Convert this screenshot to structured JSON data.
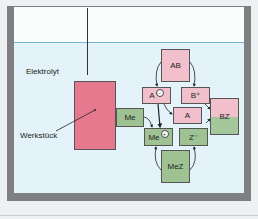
{
  "diagram": {
    "labels": {
      "electrolyte": "Elektrolyt",
      "workpiece": "Werkstück"
    },
    "boxes": {
      "me": "Me",
      "ab": "AB",
      "a_minus": "A",
      "a_minus_charge": "−",
      "b_plus": "B⁺",
      "a": "A",
      "bz": "BZ",
      "me_plus": "Me",
      "me_plus_charge": "+",
      "z_minus": "Z⁻",
      "mez": "MeZ"
    },
    "colors": {
      "tank_wall": "#7d7f80",
      "electrolyte": "#e3f3f9",
      "surface_line": "#6fb6da",
      "workpiece": "#e7798e",
      "pink_box": "#f2c0cc",
      "green_box": "#9fc293"
    }
  }
}
